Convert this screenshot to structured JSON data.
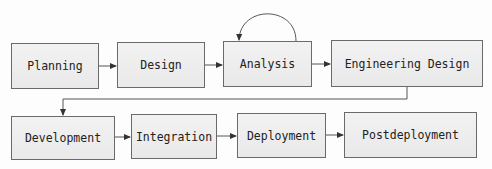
{
  "diagram": {
    "type": "process-flow",
    "nodes": [
      {
        "id": "planning",
        "label": "Planning",
        "x": 11,
        "y": 43,
        "w": 88,
        "h": 46
      },
      {
        "id": "design",
        "label": "Design",
        "x": 117,
        "y": 42,
        "w": 88,
        "h": 46
      },
      {
        "id": "analysis",
        "label": "Analysis",
        "x": 223,
        "y": 41,
        "w": 89,
        "h": 46
      },
      {
        "id": "engineering_design",
        "label": "Engineering Design",
        "x": 331,
        "y": 40,
        "w": 152,
        "h": 47
      },
      {
        "id": "development",
        "label": "Development",
        "x": 11,
        "y": 116,
        "w": 104,
        "h": 44
      },
      {
        "id": "integration",
        "label": "Integration",
        "x": 131,
        "y": 114,
        "w": 86,
        "h": 45
      },
      {
        "id": "deployment",
        "label": "Deployment",
        "x": 237,
        "y": 113,
        "w": 89,
        "h": 45
      },
      {
        "id": "postdeployment",
        "label": "Postdeployment",
        "x": 344,
        "y": 112,
        "w": 133,
        "h": 46
      }
    ],
    "edges": [
      {
        "from": "planning",
        "to": "design"
      },
      {
        "from": "design",
        "to": "analysis"
      },
      {
        "from": "analysis",
        "to": "analysis",
        "kind": "self-loop"
      },
      {
        "from": "analysis",
        "to": "engineering_design"
      },
      {
        "from": "engineering_design",
        "to": "development",
        "kind": "elbow"
      },
      {
        "from": "development",
        "to": "integration"
      },
      {
        "from": "integration",
        "to": "deployment"
      },
      {
        "from": "deployment",
        "to": "postdeployment"
      }
    ],
    "colors": {
      "box_fill": "#eeeeee",
      "box_border": "#6a6a6a",
      "edge": "#444444",
      "text": "#222222"
    }
  }
}
